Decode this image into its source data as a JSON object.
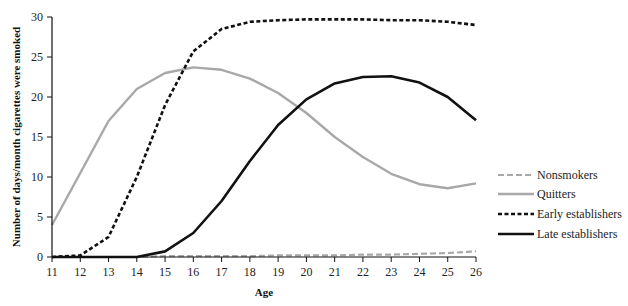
{
  "chart_data": {
    "type": "line",
    "title": "",
    "xlabel": "Age",
    "ylabel": "Number of days/month cigarettes were smoked",
    "x": [
      11,
      12,
      13,
      14,
      15,
      16,
      17,
      18,
      19,
      20,
      21,
      22,
      23,
      24,
      25,
      26
    ],
    "xlim": [
      11,
      26
    ],
    "ylim": [
      0,
      30
    ],
    "yticks": [
      0,
      5,
      10,
      15,
      20,
      25,
      30
    ],
    "grid": false,
    "legend_position": "right",
    "series": [
      {
        "name": "Nonsmokers",
        "style": "dashed",
        "color": "#a8a8a8",
        "values": [
          0,
          0,
          0,
          0,
          0.1,
          0.1,
          0.1,
          0.1,
          0.2,
          0.2,
          0.2,
          0.3,
          0.3,
          0.4,
          0.5,
          0.7
        ]
      },
      {
        "name": "Quitters",
        "style": "solid",
        "color": "#a8a8a8",
        "values": [
          4,
          10.5,
          17,
          21,
          23,
          23.7,
          23.4,
          22.3,
          20.5,
          18,
          15,
          12.5,
          10.4,
          9.1,
          8.6,
          9.2
        ]
      },
      {
        "name": "Early establishers",
        "style": "dotted",
        "color": "#111111",
        "values": [
          0,
          0.2,
          2.5,
          10,
          19,
          25.7,
          28.5,
          29.4,
          29.6,
          29.7,
          29.7,
          29.7,
          29.6,
          29.6,
          29.4,
          29
        ]
      },
      {
        "name": "Late establishers",
        "style": "solid",
        "color": "#111111",
        "values": [
          0,
          0,
          0,
          0,
          0.7,
          3,
          7,
          12,
          16.5,
          19.7,
          21.7,
          22.5,
          22.6,
          21.8,
          20,
          17.1
        ]
      }
    ]
  },
  "legend": {
    "items": [
      {
        "label": "Nonsmokers"
      },
      {
        "label": "Quitters"
      },
      {
        "label": "Early establishers"
      },
      {
        "label": "Late establishers"
      }
    ]
  }
}
